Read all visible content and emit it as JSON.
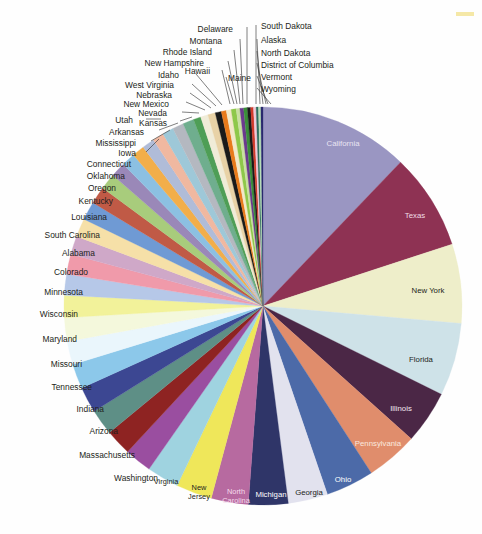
{
  "figure": {
    "title": "",
    "type": "pie-chart",
    "corner_mark_color": "#f2e08a",
    "center": {
      "x": 263,
      "y": 306
    },
    "radius": 199,
    "start_angle_deg": -90,
    "direction": "clockwise"
  },
  "chart_data": {
    "type": "pie",
    "title": "",
    "xlabel": "",
    "ylabel": "",
    "legend_position": "none",
    "grid": false,
    "units": "share of total (percent)",
    "categories": [
      "California",
      "Texas",
      "New York",
      "Florida",
      "Illinois",
      "Pennsylvania",
      "Ohio",
      "Georgia",
      "Michigan",
      "North Carolina",
      "New Jersey",
      "Virginia",
      "Washington",
      "Massachusetts",
      "Arizona",
      "Indiana",
      "Tennessee",
      "Missouri",
      "Maryland",
      "Wisconsin",
      "Minnesota",
      "Colorado",
      "Alabama",
      "South Carolina",
      "Louisiana",
      "Kentucky",
      "Oregon",
      "Oklahoma",
      "Connecticut",
      "Iowa",
      "Mississippi",
      "Arkansas",
      "Kansas",
      "Utah",
      "Nevada",
      "New Mexico",
      "Nebraska",
      "West Virginia",
      "Idaho",
      "Hawaii",
      "Maine",
      "New Hampshire",
      "Rhode Island",
      "Montana",
      "Delaware",
      "South Dakota",
      "Alaska",
      "North Dakota",
      "District of Columbia",
      "Vermont",
      "Wyoming"
    ],
    "values": [
      12.1,
      7.8,
      6.4,
      5.9,
      4.3,
      4.2,
      3.9,
      3.2,
      3.2,
      3.0,
      2.9,
      2.6,
      2.2,
      2.1,
      2.1,
      2.1,
      2.0,
      1.9,
      1.9,
      1.8,
      1.7,
      1.6,
      1.5,
      1.5,
      1.5,
      1.4,
      1.3,
      1.2,
      1.1,
      1.0,
      1.0,
      0.9,
      0.9,
      0.9,
      0.9,
      0.6,
      0.6,
      0.6,
      0.5,
      0.4,
      0.4,
      0.4,
      0.3,
      0.3,
      0.3,
      0.26,
      0.23,
      0.21,
      0.19,
      0.19,
      0.17
    ],
    "colors": [
      "#9a96c2",
      "#8e3253",
      "#eeeeca",
      "#cee2e8",
      "#4b2746",
      "#e08d6c",
      "#4c6aa8",
      "#e2e2ee",
      "#2f3568",
      "#b76aa0",
      "#efe75a",
      "#9fd3e0",
      "#9a4ea0",
      "#8e2322",
      "#5e8f86",
      "#3c4792",
      "#8cc8ea",
      "#eaf6fc",
      "#f4f8dc",
      "#f2f29a",
      "#b6c8e8",
      "#f09aaa",
      "#cfa8c8",
      "#f6e0a8",
      "#6f9ad4",
      "#c05a46",
      "#a8cc7c",
      "#9a88b8",
      "#8cc0e2",
      "#f2ae4a",
      "#b0bcd8",
      "#f0b8a0",
      "#9ec8d8",
      "#b4b8c0",
      "#6fae8e",
      "#4e9e56",
      "#f0ecd8",
      "#e8d2a6",
      "#1a1a1a",
      "#e87a1a",
      "#f2e8c8",
      "#8ec84a",
      "#c8e0a0",
      "#6b3a8e",
      "#3a8e3a",
      "#1a1a1a",
      "#d03a2a",
      "#f0c8d8",
      "#2e6e5e",
      "#b8e0b8",
      "#2a2a6e"
    ],
    "label_style": {
      "inside_labels": [
        "California",
        "Texas",
        "New York",
        "Florida",
        "Illinois",
        "Pennsylvania",
        "Ohio",
        "Georgia",
        "Michigan",
        "North Carolina",
        "New Jersey",
        "Virginia"
      ],
      "outside_labels": [
        "Washington",
        "Massachusetts",
        "Arizona",
        "Indiana",
        "Tennessee",
        "Missouri",
        "Maryland",
        "Wisconsin",
        "Minnesota",
        "Colorado",
        "Alabama",
        "South Carolina",
        "Louisiana",
        "Kentucky",
        "Oregon",
        "Oklahoma",
        "Connecticut",
        "Iowa",
        "Mississippi",
        "Arkansas",
        "Kansas",
        "Utah",
        "Nevada",
        "New Mexico",
        "Nebraska",
        "West Virginia",
        "Idaho",
        "Hawaii",
        "Maine",
        "New Hampshire",
        "Rhode Island",
        "Montana",
        "Delaware",
        "South Dakota",
        "Alaska",
        "North Dakota",
        "District of Columbia",
        "Vermont",
        "Wyoming"
      ]
    }
  },
  "inside_label_colors": {
    "California": "#e8e4f2",
    "Texas": "#f0dde4",
    "New York": "#231f20",
    "Florida": "#231f20",
    "Illinois": "#f2e8f0",
    "Pennsylvania": "#fbe8de",
    "Ohio": "#ffffff",
    "Georgia": "#231f20",
    "Michigan": "#ffffff",
    "North Carolina": "#f6dcec",
    "New Jersey": "#231f20",
    "Virginia": "#231f20"
  },
  "callouts": [
    {
      "label": "Delaware",
      "tx": 233,
      "ty": 30,
      "anchor": "end",
      "lx": 247,
      "ly": 27,
      "px": 247,
      "py": 104
    },
    {
      "label": "South Dakota",
      "tx": 261,
      "ty": 27,
      "anchor": "start",
      "lx": 256,
      "ly": 25,
      "px": 256,
      "py": 104
    },
    {
      "label": "Montana",
      "tx": 222,
      "ty": 42,
      "anchor": "end",
      "lx": 240,
      "ly": 39,
      "px": 243,
      "py": 104
    },
    {
      "label": "Alaska",
      "tx": 261,
      "ty": 41,
      "anchor": "start",
      "lx": 257,
      "ly": 39,
      "px": 260,
      "py": 104
    },
    {
      "label": "Rhode Island",
      "tx": 212,
      "ty": 53,
      "anchor": "end",
      "lx": 234,
      "ly": 50,
      "px": 240,
      "py": 104
    },
    {
      "label": "North Dakota",
      "tx": 261,
      "ty": 54,
      "anchor": "start",
      "lx": 257,
      "ly": 51,
      "px": 263,
      "py": 104
    },
    {
      "label": "New Hampshire",
      "tx": 204,
      "ty": 64,
      "anchor": "end",
      "lx": 228,
      "ly": 61,
      "px": 237,
      "py": 104
    },
    {
      "label": "District of Columbia",
      "tx": 261,
      "ty": 66,
      "anchor": "start",
      "lx": 257,
      "ly": 63,
      "px": 266,
      "py": 104
    },
    {
      "label": "Idaho",
      "tx": 179,
      "ty": 76,
      "anchor": "end",
      "lx": 196,
      "ly": 74,
      "px": 222,
      "py": 105
    },
    {
      "label": "Hawaii",
      "tx": 210,
      "ty": 72,
      "anchor": "end",
      "lx": 222,
      "ly": 70,
      "px": 230,
      "py": 104
    },
    {
      "label": "Maine",
      "tx": 228,
      "ty": 79,
      "anchor": "start",
      "lx": 226,
      "ly": 77,
      "px": 234,
      "py": 104
    },
    {
      "label": "Vermont",
      "tx": 261,
      "ty": 78,
      "anchor": "start",
      "lx": 257,
      "ly": 76,
      "px": 268,
      "py": 104
    },
    {
      "label": "West Virginia",
      "tx": 174,
      "ty": 86,
      "anchor": "end",
      "lx": 192,
      "ly": 84,
      "px": 216,
      "py": 106
    },
    {
      "label": "Nebraska",
      "tx": 172,
      "ty": 96,
      "anchor": "end",
      "lx": 190,
      "ly": 93,
      "px": 211,
      "py": 108
    },
    {
      "label": "Wyoming",
      "tx": 261,
      "ty": 90,
      "anchor": "start",
      "lx": 257,
      "ly": 88,
      "px": 271,
      "py": 104
    },
    {
      "label": "New Mexico",
      "tx": 169,
      "ty": 105,
      "anchor": "end",
      "lx": 186,
      "ly": 102,
      "px": 205,
      "py": 110
    },
    {
      "label": "Nevada",
      "tx": 167,
      "ty": 114,
      "anchor": "end",
      "lx": 182,
      "ly": 112,
      "px": 199,
      "py": 113
    },
    {
      "label": "Kansas",
      "tx": 167,
      "ty": 124,
      "anchor": "end",
      "lx": 180,
      "ly": 121,
      "px": 192,
      "py": 117
    },
    {
      "label": "Utah",
      "tx": 133,
      "ty": 121,
      "anchor": "end",
      "lx": 146,
      "ly": 119,
      "px": 161,
      "py": 119
    },
    {
      "label": "Arkansas",
      "tx": 144,
      "ty": 133,
      "anchor": "end",
      "lx": 159,
      "ly": 130,
      "px": 178,
      "py": 123
    },
    {
      "label": "Mississippi",
      "tx": 136,
      "ty": 144,
      "anchor": "end",
      "lx": 151,
      "ly": 141,
      "px": 170,
      "py": 130
    },
    {
      "label": "Iowa",
      "tx": 136,
      "ty": 154,
      "anchor": "end",
      "lx": 146,
      "ly": 152,
      "px": 159,
      "py": 139
    },
    {
      "label": "Connecticut",
      "tx": 131,
      "ty": 165,
      "anchor": "end",
      "lx": 131,
      "ly": 165,
      "px": 131,
      "py": 165
    },
    {
      "label": "Oklahoma",
      "tx": 125,
      "ty": 177,
      "anchor": "end",
      "lx": 125,
      "ly": 177,
      "px": 125,
      "py": 177
    },
    {
      "label": "Oregon",
      "tx": 116,
      "ty": 189,
      "anchor": "end",
      "lx": 116,
      "ly": 189,
      "px": 116,
      "py": 189
    },
    {
      "label": "Kentucky",
      "tx": 113,
      "ty": 202,
      "anchor": "end",
      "lx": 113,
      "ly": 202,
      "px": 113,
      "py": 202
    },
    {
      "label": "Louisiana",
      "tx": 107,
      "ty": 218,
      "anchor": "end",
      "lx": 107,
      "ly": 218,
      "px": 107,
      "py": 218
    },
    {
      "label": "South Carolina",
      "tx": 100,
      "ty": 236,
      "anchor": "end",
      "lx": 100,
      "ly": 236,
      "px": 100,
      "py": 236
    },
    {
      "label": "Alabama",
      "tx": 95,
      "ty": 254,
      "anchor": "end",
      "lx": 95,
      "ly": 254,
      "px": 95,
      "py": 254
    },
    {
      "label": "Colorado",
      "tx": 88,
      "ty": 273,
      "anchor": "end",
      "lx": 88,
      "ly": 273,
      "px": 88,
      "py": 273
    },
    {
      "label": "Minnesota",
      "tx": 83,
      "ty": 293,
      "anchor": "end",
      "lx": 83,
      "ly": 293,
      "px": 83,
      "py": 293
    },
    {
      "label": "Wisconsin",
      "tx": 78,
      "ty": 315,
      "anchor": "end",
      "lx": 78,
      "ly": 315,
      "px": 78,
      "py": 315
    },
    {
      "label": "Maryland",
      "tx": 77,
      "ty": 340,
      "anchor": "end",
      "lx": 77,
      "ly": 340,
      "px": 77,
      "py": 340
    },
    {
      "label": "Missouri",
      "tx": 82,
      "ty": 365,
      "anchor": "end",
      "lx": 82,
      "ly": 365,
      "px": 82,
      "py": 365
    },
    {
      "label": "Tennessee",
      "tx": 92,
      "ty": 388,
      "anchor": "end",
      "lx": 92,
      "ly": 388,
      "px": 92,
      "py": 388
    },
    {
      "label": "Indiana",
      "tx": 104,
      "ty": 410,
      "anchor": "end",
      "lx": 104,
      "ly": 410,
      "px": 104,
      "py": 410
    },
    {
      "label": "Arizona",
      "tx": 118,
      "ty": 432,
      "anchor": "end",
      "lx": 118,
      "ly": 432,
      "px": 118,
      "py": 432
    },
    {
      "label": "Massachusetts",
      "tx": 135,
      "ty": 456,
      "anchor": "end",
      "lx": 135,
      "ly": 456,
      "px": 135,
      "py": 456
    },
    {
      "label": "Washington",
      "tx": 158,
      "ty": 479,
      "anchor": "end",
      "lx": 158,
      "ly": 479,
      "px": 158,
      "py": 479
    }
  ],
  "inside_labels": [
    {
      "label": "California",
      "x": 343,
      "y": 146,
      "size": 7.8
    },
    {
      "label": "Texas",
      "x": 415,
      "y": 218,
      "size": 7.8
    },
    {
      "label": "New York",
      "x": 428,
      "y": 293,
      "size": 7.8
    },
    {
      "label": "Florida",
      "x": 421,
      "y": 362,
      "size": 7.8
    },
    {
      "label": "Illinois",
      "x": 401,
      "y": 411,
      "size": 7.8
    },
    {
      "label": "Pennsylvania",
      "x": 378,
      "y": 446,
      "size": 7.8
    },
    {
      "label": "Ohio",
      "x": 343,
      "y": 482,
      "size": 7.8
    },
    {
      "label": "Georgia",
      "x": 309,
      "y": 495,
      "size": 7.8
    },
    {
      "label": "Michigan",
      "x": 271,
      "y": 497,
      "size": 7.8
    },
    {
      "label": "North Carolina",
      "x": 236,
      "y": 494,
      "size": 7.4,
      "line2": "Carolina"
    },
    {
      "label": "New Jersey",
      "x": 199,
      "y": 490,
      "size": 7.4,
      "line2": "Jersey"
    },
    {
      "label": "Virginia",
      "x": 166,
      "y": 484,
      "size": 7.4
    }
  ]
}
